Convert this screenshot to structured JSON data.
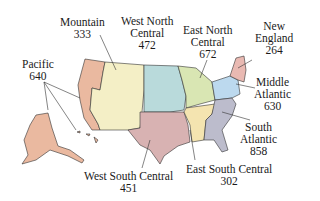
{
  "map": {
    "type": "US census divisions",
    "regions": [
      {
        "id": "pacific",
        "name": "Pacific",
        "value": "640",
        "color": "#eab9a0"
      },
      {
        "id": "mountain",
        "name": "Mountain",
        "value": "333",
        "color": "#f4efc6"
      },
      {
        "id": "west-north-central",
        "name_line1": "West North",
        "name_line2": "Central",
        "value": "472",
        "color": "#b9dadb"
      },
      {
        "id": "east-north-central",
        "name_line1": "East North",
        "name_line2": "Central",
        "value": "672",
        "color": "#d9e6b3"
      },
      {
        "id": "new-england",
        "name_line1": "New",
        "name_line2": "England",
        "value": "264",
        "color": "#e9b9b2"
      },
      {
        "id": "middle-atlantic",
        "name_line1": "Middle",
        "name_line2": "Atlantic",
        "value": "630",
        "color": "#bcd9ee"
      },
      {
        "id": "south-atlantic",
        "name_line1": "South",
        "name_line2": "Atlantic",
        "value": "858",
        "color": "#bcbccc"
      },
      {
        "id": "east-south-central",
        "name": "East South Central",
        "value": "302",
        "color": "#f4e4b0"
      },
      {
        "id": "west-south-central",
        "name": "West South Central",
        "value": "451",
        "color": "#d8b2b2"
      }
    ]
  }
}
